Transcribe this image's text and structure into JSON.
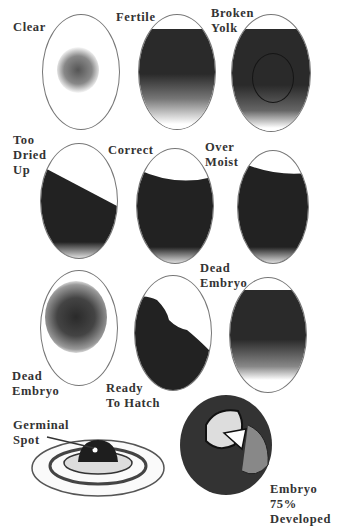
{
  "figure": {
    "rows": [
      [
        {
          "label": "Clear",
          "state": "clear"
        },
        {
          "label": "Fertile",
          "state": "fertile"
        },
        {
          "label": "Broken\nYolk",
          "state": "broken-yolk"
        }
      ],
      [
        {
          "label": "Too\nDried\nUp",
          "state": "too-dried-up"
        },
        {
          "label": "Correct",
          "state": "correct"
        },
        {
          "label": "Over\nMoist",
          "state": "over-moist"
        }
      ],
      [
        {
          "label": "Dead\nEmbryo",
          "state": "dead-embryo-early"
        },
        {
          "label": "Ready\nTo Hatch",
          "state": "ready-to-hatch"
        },
        {
          "label": "Dead\nEmbryo",
          "state": "dead-embryo-late"
        }
      ]
    ],
    "bottom": {
      "germinal_label": "Germinal\nSpot",
      "embryo_label": "Embryo\n75%\nDeveloped"
    },
    "colors": {
      "ink": "#1e1e1e",
      "outline": "#777777",
      "paper": "#ffffff"
    }
  }
}
